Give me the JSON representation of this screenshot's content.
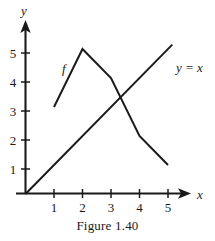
{
  "figure": {
    "caption": "Figure 1.40",
    "axis_x_label": "x",
    "axis_y_label": "y",
    "line_label": "y = x",
    "function_label": "f",
    "ink_color": "#1a1a1a",
    "background_color": "#ffffff"
  },
  "chart_data": {
    "type": "line",
    "title": "Figure 1.40",
    "xlabel": "x",
    "ylabel": "y",
    "xlim": [
      0,
      5.9
    ],
    "ylim": [
      0,
      5.7
    ],
    "xticks": [
      1,
      2,
      3,
      4,
      5
    ],
    "yticks": [
      1,
      2,
      3,
      4,
      5
    ],
    "xtick_labels": [
      "1",
      "2",
      "3",
      "4",
      "5"
    ],
    "ytick_labels": [
      "1",
      "2",
      "3",
      "4",
      "5"
    ],
    "grid": false,
    "legend": false,
    "annotations": [
      {
        "text": "f",
        "x": 1.35,
        "y": 4.35,
        "italic": true
      },
      {
        "text": "y = x",
        "x": 5.15,
        "y": 4.55,
        "italic": true
      }
    ],
    "series": [
      {
        "name": "f",
        "label": "f",
        "x": [
          1,
          2,
          3,
          4,
          5
        ],
        "values": [
          3,
          5,
          4,
          2,
          1
        ]
      },
      {
        "name": "y = x",
        "label": "y = x",
        "x": [
          0,
          5.15
        ],
        "values": [
          0,
          5.15
        ]
      }
    ]
  }
}
